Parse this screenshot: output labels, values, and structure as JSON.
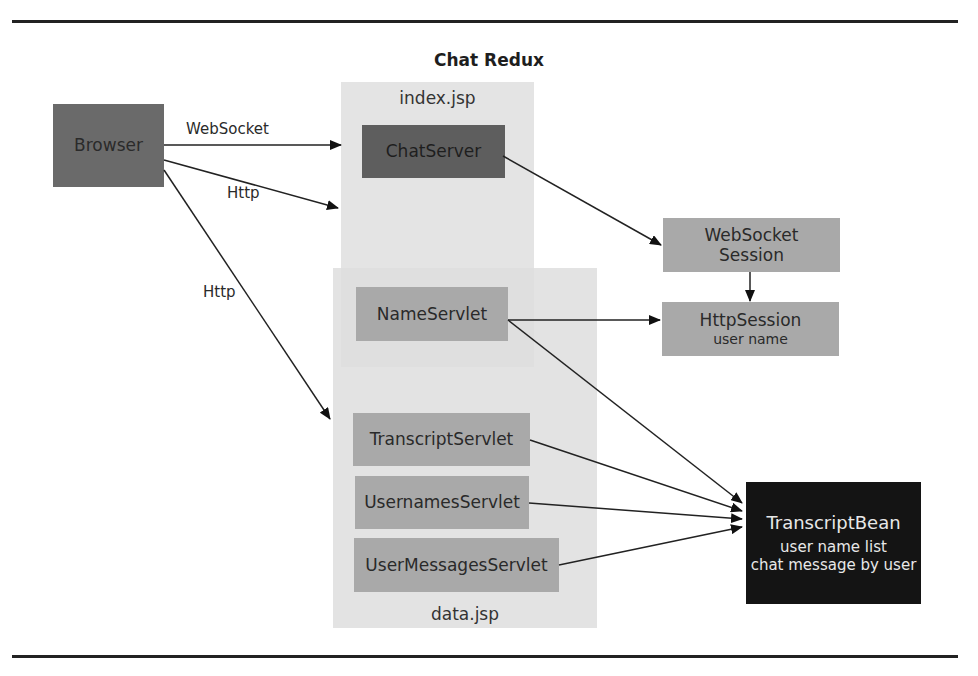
{
  "diagram": {
    "title": "Chat Redux",
    "regions": {
      "index": {
        "label": "index.jsp"
      },
      "data": {
        "label": "data.jsp"
      }
    },
    "nodes": {
      "browser": {
        "label": "Browser"
      },
      "chat_server": {
        "label": "ChatServer"
      },
      "websocket_session": {
        "label_line1": "WebSocket",
        "label_line2": "Session"
      },
      "http_session": {
        "label": "HttpSession",
        "sub": "user name"
      },
      "name_servlet": {
        "label": "NameServlet"
      },
      "transcript_servlet": {
        "label": "TranscriptServlet"
      },
      "usernames_servlet": {
        "label": "UsernamesServlet"
      },
      "user_messages_servlet": {
        "label": "UserMessagesServlet"
      },
      "transcript_bean": {
        "label": "TranscriptBean",
        "sub1": "user name list",
        "sub2": "chat message by user"
      }
    },
    "edges": [
      {
        "from": "Browser",
        "to": "ChatServer",
        "label": "WebSocket"
      },
      {
        "from": "Browser",
        "to": "index.jsp",
        "label": "Http"
      },
      {
        "from": "Browser",
        "to": "data.jsp",
        "label": "Http"
      },
      {
        "from": "ChatServer",
        "to": "WebSocket Session",
        "label": ""
      },
      {
        "from": "WebSocket Session",
        "to": "HttpSession",
        "label": ""
      },
      {
        "from": "NameServlet",
        "to": "HttpSession",
        "label": ""
      },
      {
        "from": "NameServlet",
        "to": "TranscriptBean",
        "label": ""
      },
      {
        "from": "TranscriptServlet",
        "to": "TranscriptBean",
        "label": ""
      },
      {
        "from": "UsernamesServlet",
        "to": "TranscriptBean",
        "label": ""
      },
      {
        "from": "UserMessagesServlet",
        "to": "TranscriptBean",
        "label": ""
      }
    ],
    "colors": {
      "region": "#e4e4e4",
      "node_mid": "#a9a9a9",
      "node_dark": "#5e5e5e",
      "node_black": "#141414"
    }
  }
}
